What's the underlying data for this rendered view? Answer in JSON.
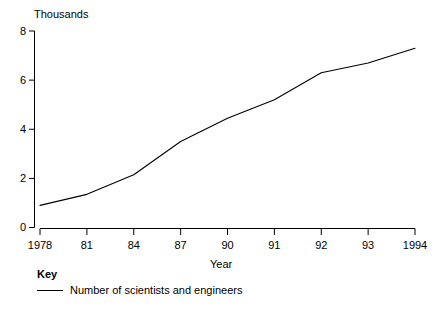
{
  "chart_data": {
    "type": "line",
    "title": "",
    "xlabel": "Year",
    "ylabel": "Thousands",
    "ylim": [
      0,
      8
    ],
    "grid": false,
    "legend_position": "bottom-left",
    "legend_title": "Key",
    "categories": [
      "1978",
      "81",
      "84",
      "87",
      "90",
      "91",
      "92",
      "93",
      "1994"
    ],
    "ytick_labels": [
      "0",
      "2",
      "4",
      "6",
      "8"
    ],
    "ytick_values": [
      0,
      2,
      4,
      6,
      8
    ],
    "series": [
      {
        "name": "Number of scientists and engineers",
        "values": [
          0.9,
          1.35,
          2.15,
          3.5,
          4.45,
          5.2,
          6.3,
          6.7,
          7.3
        ]
      }
    ]
  },
  "axis": {
    "y_unit_label": "Thousands",
    "x_title": "Year"
  },
  "key": {
    "title": "Key",
    "entries": [
      {
        "label": "Number of scientists and engineers"
      }
    ]
  }
}
